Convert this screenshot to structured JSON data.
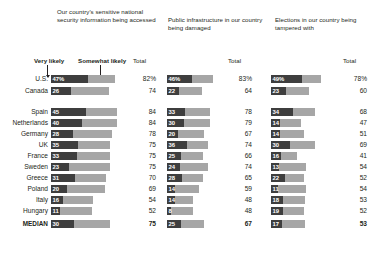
{
  "legend": {
    "very_likely": "Very likely",
    "somewhat_likely": "Somewhat likely",
    "total": "Total"
  },
  "panels": [
    {
      "title": "Our country's sensitive national security information being accessed"
    },
    {
      "title": "Public infrastructure in our country being damaged"
    },
    {
      "title": "Elections in our country being tampered with"
    }
  ],
  "chart_data": {
    "type": "bar",
    "subtype": "stacked-horizontal",
    "title": "",
    "xlabel": "",
    "ylabel": "",
    "xlim": [
      0,
      100
    ],
    "grid": false,
    "legend_position": "top",
    "series": [
      {
        "name": "Very likely",
        "color": "#3e3e3e"
      },
      {
        "name": "Somewhat likely",
        "color": "#a6a6a6"
      }
    ],
    "categories": [
      "U.S.",
      "Canada",
      "Spain",
      "Netherlands",
      "Germany",
      "UK",
      "France",
      "Sweden",
      "Greece",
      "Poland",
      "Italy",
      "Hungary",
      "MEDIAN"
    ],
    "panels": [
      {
        "name": "Our country's sensitive national security information being accessed",
        "very_likely": [
          47,
          26,
          45,
          40,
          28,
          35,
          33,
          23,
          31,
          20,
          16,
          11,
          30
        ],
        "total": [
          82,
          74,
          84,
          84,
          78,
          75,
          75,
          75,
          70,
          69,
          54,
          52,
          75
        ],
        "total_labels": [
          "82%",
          "74",
          "84",
          "84",
          "78",
          "75",
          "75",
          "75",
          "70",
          "69",
          "54",
          "52",
          "75"
        ],
        "bar_labels": [
          "47%",
          "26",
          "45",
          "40",
          "28",
          "35",
          "33",
          "23",
          "31",
          "20",
          "16",
          "11",
          "30"
        ]
      },
      {
        "name": "Public infrastructure in our country being damaged",
        "very_likely": [
          46,
          22,
          33,
          30,
          20,
          36,
          25,
          24,
          28,
          14,
          14,
          8,
          25
        ],
        "total": [
          83,
          64,
          78,
          79,
          67,
          74,
          66,
          74,
          65,
          59,
          48,
          48,
          67
        ],
        "total_labels": [
          "83%",
          "64",
          "78",
          "79",
          "67",
          "74",
          "66",
          "74",
          "65",
          "59",
          "48",
          "48",
          "67"
        ],
        "bar_labels": [
          "46%",
          "22",
          "33",
          "30",
          "20",
          "36",
          "25",
          "24",
          "28",
          "14",
          "14",
          "8",
          "25"
        ]
      },
      {
        "name": "Elections in our country being tampered with",
        "very_likely": [
          49,
          23,
          34,
          14,
          14,
          30,
          16,
          13,
          22,
          11,
          18,
          19,
          17
        ],
        "total": [
          78,
          60,
          68,
          47,
          51,
          69,
          41,
          54,
          52,
          54,
          53,
          52,
          53
        ],
        "total_labels": [
          "78%",
          "60",
          "68",
          "47",
          "51",
          "69",
          "41",
          "54",
          "52",
          "54",
          "53",
          "52",
          "53"
        ],
        "bar_labels": [
          "49%",
          "23",
          "34",
          "14",
          "14",
          "30",
          "16",
          "13",
          "22",
          "11",
          "18",
          "19",
          "17"
        ]
      }
    ]
  }
}
